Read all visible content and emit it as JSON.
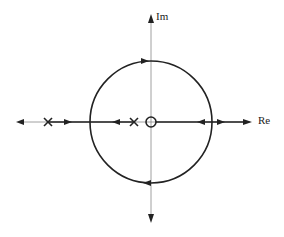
{
  "diagram": {
    "type": "root-locus",
    "axes": {
      "real_label": "Re",
      "imag_label": "Im"
    },
    "poles": [
      {
        "x": -103
      },
      {
        "x": -17
      }
    ],
    "zeros": [
      {
        "x": 0
      }
    ],
    "circle": {
      "center": [
        151,
        122
      ],
      "radius": 61
    },
    "colors": {
      "stroke": "#222222",
      "axis": "#888888",
      "background": "#ffffff"
    }
  }
}
